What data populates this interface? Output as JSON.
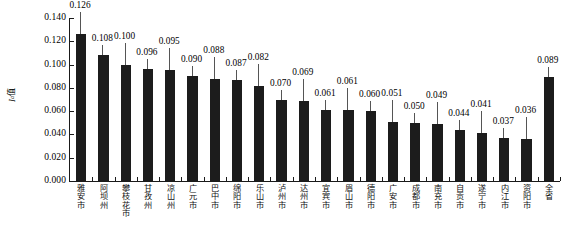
{
  "chart_data": {
    "type": "bar",
    "title": "",
    "xlabel": "",
    "ylabel": "I_a 值",
    "ylabel_symbol": "I",
    "ylabel_sub": "a",
    "ylabel_cn": "值",
    "ylim": [
      0.0,
      0.14
    ],
    "ytick_step": 0.02,
    "ytick_labels": [
      "0.000",
      "0.020",
      "0.040",
      "0.060",
      "0.080",
      "0.100",
      "0.120",
      "0.140"
    ],
    "ytick_values": [
      0.0,
      0.02,
      0.04,
      0.06,
      0.08,
      0.1,
      0.12,
      0.14
    ],
    "grid": false,
    "legend": null,
    "bar_color": "#1c1c1c",
    "axis_color": "#1a1a1a",
    "categories": [
      "雅安市",
      "阿坝州",
      "攀枝花市",
      "甘孜州",
      "凉山州",
      "广元市",
      "巴中市",
      "绵阳市",
      "乐山市",
      "泸州市",
      "达州市",
      "宜宾市",
      "眉山市",
      "德阳市",
      "广安市",
      "成都市",
      "南充市",
      "自贡市",
      "遂宁市",
      "内江市",
      "资阳市",
      "全省"
    ],
    "values": [
      0.126,
      0.108,
      0.1,
      0.096,
      0.095,
      0.09,
      0.088,
      0.087,
      0.082,
      0.07,
      0.069,
      0.061,
      0.061,
      0.06,
      0.051,
      0.05,
      0.049,
      0.044,
      0.041,
      0.037,
      0.036,
      0.089
    ],
    "value_labels": [
      "0.126",
      "0.108",
      "0.100",
      "0.096",
      "0.095",
      "0.090",
      "0.088",
      "0.087",
      "0.082",
      "0.070",
      "0.069",
      "0.061",
      "0.061",
      "0.060",
      "0.051",
      "0.050",
      "0.049",
      "0.044",
      "0.041",
      "0.037",
      "0.036",
      "0.089"
    ]
  }
}
